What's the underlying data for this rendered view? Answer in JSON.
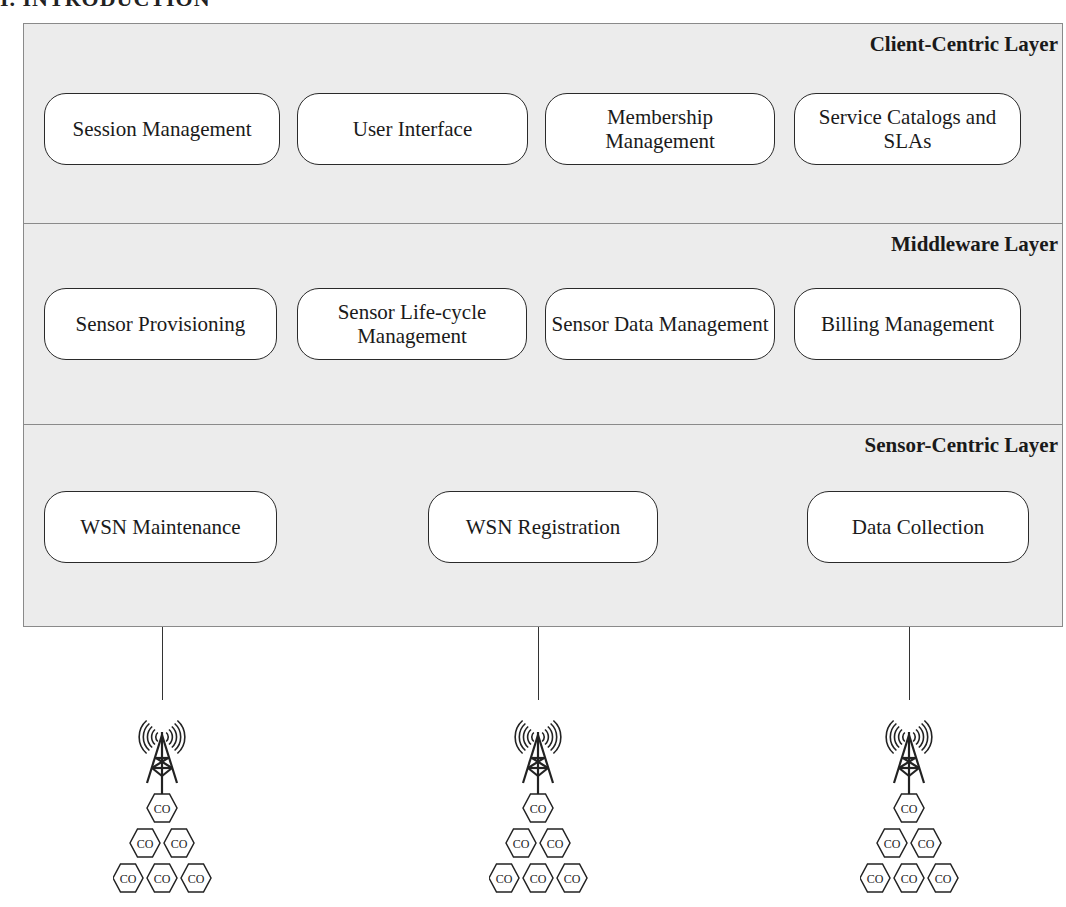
{
  "page": {
    "heading_fragment": "I. INTRODUCTION"
  },
  "layers": [
    {
      "title": "Client-Centric Layer",
      "components": [
        "Session Management",
        "User Interface",
        "Membership Management",
        "Service Catalogs and SLAs"
      ]
    },
    {
      "title": "Middleware Layer",
      "components": [
        "Sensor Provisioning",
        "Sensor Life-cycle Management",
        "Sensor Data Management",
        "Billing Management"
      ]
    },
    {
      "title": "Sensor-Centric Layer",
      "components": [
        "WSN Maintenance",
        "WSN Registration",
        "Data Collection"
      ]
    }
  ],
  "sensor_networks": [
    {
      "icon": "antenna-tower-icon",
      "node_label": "CO",
      "node_rows": [
        1,
        2,
        3
      ]
    },
    {
      "icon": "antenna-tower-icon",
      "node_label": "CO",
      "node_rows": [
        1,
        2,
        3
      ]
    },
    {
      "icon": "antenna-tower-icon",
      "node_label": "CO",
      "node_rows": [
        1,
        2,
        3
      ]
    }
  ],
  "colors": {
    "layer_fill": "#ececec",
    "box_fill": "#ffffff",
    "stroke": "#2a2a2a"
  }
}
